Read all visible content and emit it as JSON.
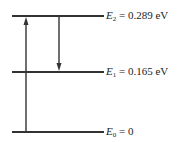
{
  "diagram": {
    "type": "energy-level-diagram",
    "levels": [
      {
        "id": "E2",
        "symbol": "E",
        "subscript": "2",
        "rest": " = 0.289 eV",
        "value_eV": 0.289,
        "y": 16
      },
      {
        "id": "E1",
        "symbol": "E",
        "subscript": "1",
        "rest": " = 0.165 eV",
        "value_eV": 0.165,
        "y": 72
      },
      {
        "id": "E0",
        "symbol": "E",
        "subscript": "0",
        "rest": " = 0",
        "value_eV": 0,
        "y": 132
      }
    ],
    "transitions": [
      {
        "from": "E0",
        "to": "E2",
        "direction": "up"
      },
      {
        "from": "E2",
        "to": "E1",
        "direction": "down"
      }
    ],
    "colors": {
      "line": "#333333",
      "text": "#222222"
    }
  }
}
